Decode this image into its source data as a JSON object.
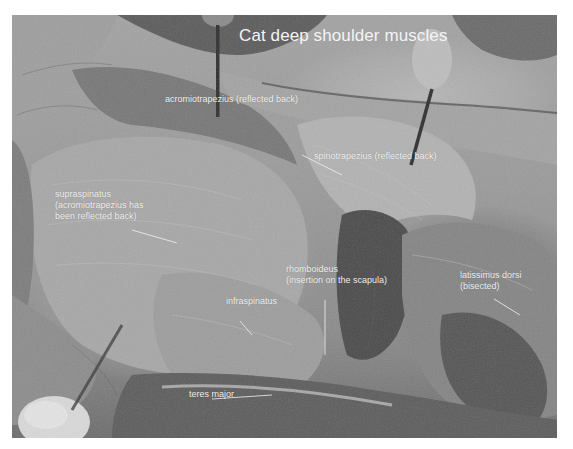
{
  "title": "Cat deep shoulder muscles",
  "labels": {
    "acromiotrapezius": "acromiotrapezius (reflected back)",
    "spinotrapezius": "spinotrapezius (reflected back)",
    "supraspinatus_line1": "supraspinatus",
    "supraspinatus_line2": "(acromiotrapezius has",
    "supraspinatus_line3": "been reflected back)",
    "rhomboideus_line1": "rhomboideus",
    "rhomboideus_line2": "(insertion on the scapula)",
    "latissimus_line1": "latissimus dorsi",
    "latissimus_line2": "(bisected)",
    "infraspinatus": "infraspinatus",
    "teres_major": "teres major"
  },
  "colors": {
    "label_text": "#f2f2f2",
    "background": "#ffffff",
    "tissue_light": "#b0b0b0",
    "tissue_dark": "#5a5a5a"
  }
}
